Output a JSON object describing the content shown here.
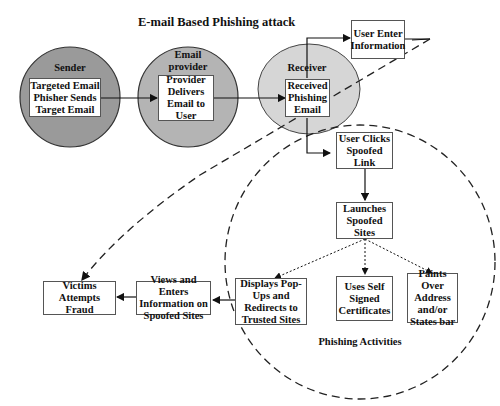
{
  "title": "E-mail Based Phishing attack",
  "colors": {
    "sender_fill": "#9a9a9a",
    "provider_fill": "#b4b4b4",
    "receiver_fill": "#d6d6d6",
    "line": "#111111",
    "box_border": "#555555"
  },
  "actors": {
    "sender": {
      "label": "Sender",
      "box": "Targeted Email\nPhisher Sends\nTarget Email"
    },
    "provider": {
      "label": "Email\nprovider",
      "box": "Provider\nDelivers\nEmail to\nUser"
    },
    "receiver": {
      "label": "Receiver",
      "box": "Received\nPhishing\nEmail"
    }
  },
  "nodes": {
    "user_enter": "User Enter\nInformation",
    "user_clicks": "User Clicks\nSpoofed Link",
    "launches": "Launches\nSpoofed Sites",
    "popups": "Displays Pop-\nUps and\nRedirects to\nTrusted  Sites",
    "self_signed": "Uses Self\nSigned\nCertificates",
    "paints_over": "Paints Over\nAddress\nand/or\nStates bar",
    "views_enters": "Views and Enters\nInformation on\nSpoofed Sites",
    "victims": "Victims\nAttempts Fraud"
  },
  "region_label": "Phishing Activities"
}
